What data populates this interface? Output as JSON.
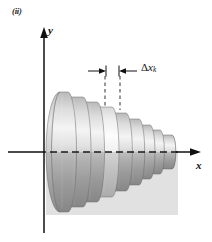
{
  "figure": {
    "panel_label": "(ii)",
    "background_color": "#ffffff",
    "axes": {
      "x_label": "x",
      "y_label": "y",
      "origin": {
        "x": 44,
        "y": 152
      },
      "x_axis_solid_color": "#111111",
      "x_axis_dashed_color": "#1a1a1a",
      "y_axis_top": 30,
      "y_axis_bottom": 233,
      "x_axis_right": 196,
      "x_axis_left": 8
    },
    "annotation": {
      "delta_symbol": "Δ",
      "variable": "x",
      "subscript": "k",
      "full_text": "Δx_k",
      "leader_left_x": 105,
      "leader_right_x": 120,
      "leader_top_y": 76,
      "leader_bottom_y": 108,
      "arrow_row_y": 71
    },
    "solid": {
      "type": "solid-of-revolution-disk-approximation",
      "disk_count": 9,
      "highlighted_disk_index": 3,
      "axis_cy": 152,
      "fill_light": "#f2f2f2",
      "fill_mid": "#c8c8c8",
      "fill_dark": "#9a9a9a",
      "fill_highlight": "#ececec",
      "edge_color": "#6f6f6f",
      "disks": [
        {
          "x_left": 52,
          "x_right": 68,
          "radius": 60,
          "ellipse_rx": 8.5
        },
        {
          "x_left": 68,
          "x_right": 83,
          "radius": 55,
          "ellipse_rx": 8.0
        },
        {
          "x_left": 83,
          "x_right": 97,
          "radius": 50,
          "ellipse_rx": 7.5
        },
        {
          "x_left": 97,
          "x_right": 112,
          "radius": 45,
          "ellipse_rx": 7.0
        },
        {
          "x_left": 112,
          "x_right": 126,
          "radius": 39,
          "ellipse_rx": 6.4
        },
        {
          "x_left": 126,
          "x_right": 139,
          "radius": 33,
          "ellipse_rx": 5.7
        },
        {
          "x_left": 139,
          "x_right": 150,
          "radius": 27,
          "ellipse_rx": 5.0
        },
        {
          "x_left": 150,
          "x_right": 160,
          "radius": 22,
          "ellipse_rx": 4.4
        },
        {
          "x_left": 160,
          "x_right": 172,
          "radius": 17,
          "ellipse_rx": 3.8
        }
      ]
    }
  }
}
